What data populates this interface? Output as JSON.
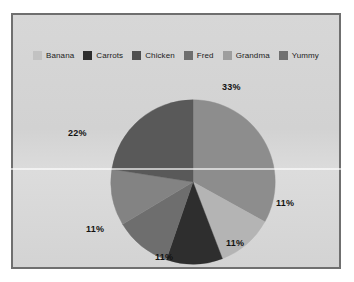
{
  "chart_data": {
    "type": "pie",
    "title": "",
    "legend_position": "top",
    "categories": [
      "Banana",
      "Carrots",
      "Chicken",
      "Fred",
      "Grandma",
      "Yummy"
    ],
    "slices": [
      {
        "label": "33%",
        "value": 33,
        "color": "#8d8d8d",
        "start_angle": 0,
        "end_angle": 119,
        "label_x": 222,
        "label_y": 82
      },
      {
        "label": "11%",
        "value": 11,
        "color": "#b4b4b4",
        "start_angle": 119,
        "end_angle": 159,
        "label_x": 276,
        "label_y": 198
      },
      {
        "label": "11%",
        "value": 11,
        "color": "#2e2e2e",
        "start_angle": 159,
        "end_angle": 199,
        "label_x": 226,
        "label_y": 238
      },
      {
        "label": "11%",
        "value": 11,
        "color": "#6e6e6e",
        "start_angle": 199,
        "end_angle": 239,
        "label_x": 155,
        "label_y": 252
      },
      {
        "label": "11%",
        "value": 11,
        "color": "#838383",
        "start_angle": 239,
        "end_angle": 279,
        "label_x": 86,
        "label_y": 224
      },
      {
        "label": "22%",
        "value": 22,
        "color": "#595959",
        "start_angle": 279,
        "end_angle": 360,
        "label_x": 68,
        "label_y": 128
      }
    ],
    "legend_entries": [
      {
        "label": "Banana",
        "color": "#c2c2c2"
      },
      {
        "label": "Carrots",
        "color": "#2e2e2e"
      },
      {
        "label": "Chicken",
        "color": "#4f4f4f"
      },
      {
        "label": "Fred",
        "color": "#6e6e6e"
      },
      {
        "label": "Grandma",
        "color": "#9e9e9e"
      },
      {
        "label": "Yummy",
        "color": "#707070"
      }
    ]
  },
  "panel": {
    "background_color": "#d4d4d4",
    "border_color": "#6f6f6f"
  }
}
